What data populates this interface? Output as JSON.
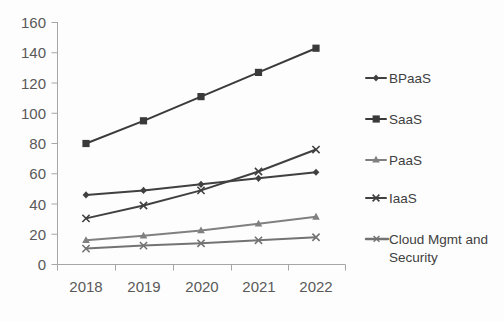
{
  "chart_data": {
    "type": "line",
    "title": "",
    "xlabel": "",
    "ylabel": "",
    "categories": [
      "2018",
      "2019",
      "2020",
      "2021",
      "2022"
    ],
    "ylim": [
      0,
      160
    ],
    "y_ticks": [
      "0",
      "20",
      "40",
      "60",
      "80",
      "100",
      "120",
      "140",
      "160"
    ],
    "grid": false,
    "legend_position": "right",
    "series": [
      {
        "name": "BPaaS",
        "values": [
          46,
          49,
          53,
          57,
          61
        ],
        "color": "#404040",
        "marker": "diamond"
      },
      {
        "name": "SaaS",
        "values": [
          80,
          95,
          111,
          127,
          143
        ],
        "color": "#3a3a3a",
        "marker": "square"
      },
      {
        "name": "PaaS",
        "values": [
          16,
          19,
          22.5,
          27,
          31.5
        ],
        "color": "#808080",
        "marker": "triangle"
      },
      {
        "name": "IaaS",
        "values": [
          30.5,
          39,
          49,
          61.5,
          76
        ],
        "color": "#404040",
        "marker": "x"
      },
      {
        "name": "Cloud Mgmt and Security",
        "values": [
          10.5,
          12.5,
          14,
          16,
          18
        ],
        "color": "#737373",
        "marker": "x"
      }
    ]
  },
  "legend": {
    "entries": [
      {
        "label": "BPaaS"
      },
      {
        "label": "SaaS"
      },
      {
        "label": "PaaS"
      },
      {
        "label": "IaaS"
      },
      {
        "label": "Cloud Mgmt and",
        "label2": "Security"
      }
    ]
  },
  "axes": {
    "y_tick_labels": [
      "160",
      "140",
      "120",
      "100",
      "80",
      "60",
      "40",
      "20",
      "0"
    ],
    "x_tick_labels": [
      "2018",
      "2019",
      "2020",
      "2021",
      "2022"
    ]
  }
}
